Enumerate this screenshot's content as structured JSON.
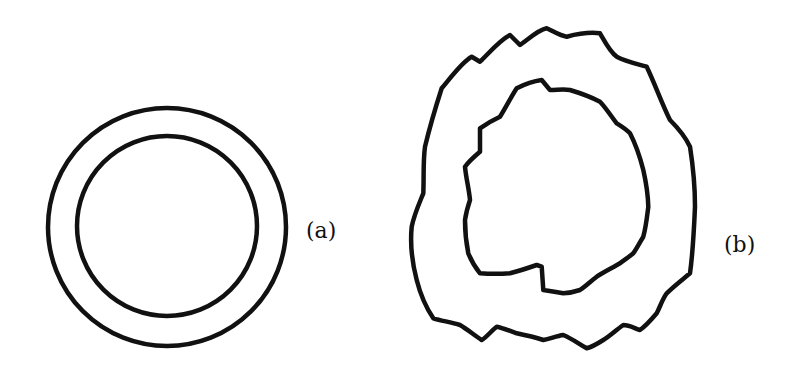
{
  "figure": {
    "stroke_color": "#111111",
    "background": "#ffffff",
    "panels": [
      {
        "id": "a",
        "label": "(a)",
        "shape": "concentric-circles",
        "outer_circle": {
          "cx": 167,
          "cy": 227,
          "r": 119
        },
        "inner_circle": {
          "cx": 167,
          "cy": 226,
          "r": 90
        }
      },
      {
        "id": "b",
        "label": "(b)",
        "shape": "irregular-concentric-boundaries"
      }
    ]
  }
}
